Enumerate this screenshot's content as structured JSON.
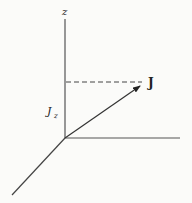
{
  "diagram": {
    "type": "3d-vector-projection",
    "axes": {
      "z_label": "z"
    },
    "vector": {
      "label": "J"
    },
    "projection": {
      "label_main": "J",
      "label_sub": "z"
    },
    "colors": {
      "line": "#333333",
      "background": "#fbfbf9"
    }
  }
}
